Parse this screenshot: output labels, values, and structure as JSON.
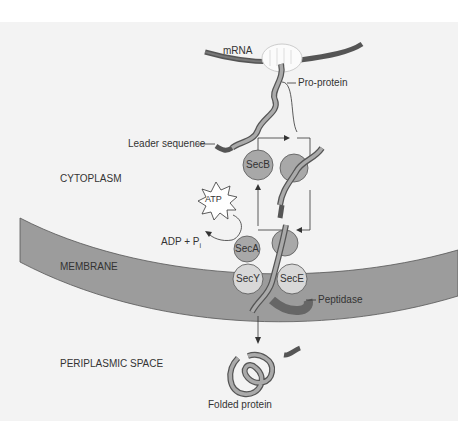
{
  "diagram": {
    "labels": {
      "mrna": "mRNA",
      "pro_protein": "Pro-protein",
      "leader_sequence": "Leader sequence",
      "cytoplasm": "CYTOPLASM",
      "atp": "ATP",
      "adp": "ADP + P",
      "adp_sub": "i",
      "membrane": "MEMBRANE",
      "periplasmic_space": "PERIPLASMIC SPACE",
      "peptidase": "Peptidase",
      "folded_protein": "Folded protein"
    },
    "proteins": {
      "secb": "SecB",
      "seca": "SecA",
      "secy": "SecY",
      "sece": "SecE"
    },
    "colors": {
      "background_panel": "#f2f2f2",
      "membrane": "#9a9a9a",
      "protein_circle": "#a8a8a8",
      "light_circle": "#d8d8d8",
      "strand": "#888888",
      "mrna": "#555555"
    }
  }
}
